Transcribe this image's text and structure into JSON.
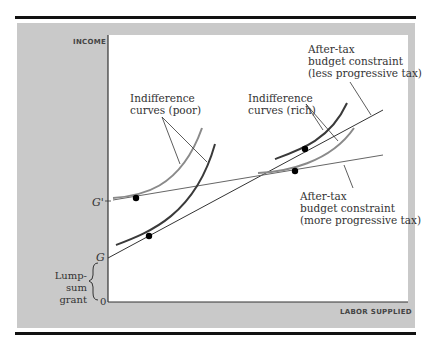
{
  "figure": {
    "axes": {
      "y_label": "INCOME",
      "x_label": "LABOR SUPPLIED",
      "origin_label": "0",
      "g_label": "G",
      "g_prime_label": "G'",
      "bracket_label_line1": "Lump-sum",
      "bracket_label_line2": "grant"
    },
    "annotations": {
      "poor_line1": "Indifference",
      "poor_line2": "curves (poor)",
      "rich_line1": "Indifference",
      "rich_line2": "curves (rich)",
      "less_line1": "After-tax",
      "less_line2": "budget constraint",
      "less_line3": "(less progressive tax)",
      "more_line1": "After-tax",
      "more_line2": "budget constraint",
      "more_line3": "(more progressive tax)"
    },
    "colors": {
      "background_panel": "#c9c9c9",
      "plot_area": "#ffffff",
      "dark_curve": "#3a3a3a",
      "light_curve": "#8a8a8a",
      "rule": "#111111"
    }
  }
}
